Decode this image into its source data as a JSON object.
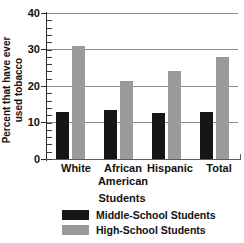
{
  "chart_data": {
    "type": "bar",
    "title": "",
    "categories": [
      "White",
      "African American",
      "Hispanic",
      "Total"
    ],
    "category_lines": [
      [
        "White"
      ],
      [
        "African",
        "American"
      ],
      [
        "Hispanic"
      ],
      [
        "Total"
      ]
    ],
    "series": [
      {
        "name": "Middle-School Students",
        "color": "#161616",
        "values": [
          13,
          13.5,
          12.5,
          13
        ]
      },
      {
        "name": "High-School Students",
        "color": "#9a9a9a",
        "values": [
          31,
          21.5,
          24.2,
          28
        ]
      }
    ],
    "xlabel": "Students",
    "ylabel": "Percent that have ever used tobacco",
    "ylabel_lines": [
      "Percent that have ever",
      "used tobacco"
    ],
    "ylim": [
      0,
      40
    ],
    "yticks": [
      0,
      10,
      20,
      30,
      40
    ],
    "ytick_labels": [
      "0",
      "10",
      "20",
      "30",
      "40"
    ],
    "y_minor_tick_step": 2,
    "grid": true,
    "grid_axis": "y",
    "legend_position": "bottom"
  },
  "axis": {
    "y_label_0": "0",
    "y_label_10": "10",
    "y_label_20": "20",
    "y_label_30": "30",
    "y_label_40": "40"
  }
}
